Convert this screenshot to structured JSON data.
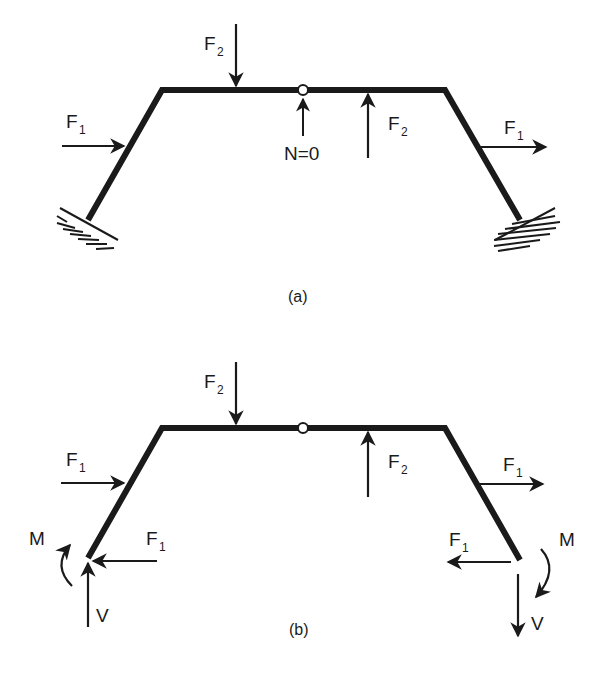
{
  "figure": {
    "panel_a": {
      "caption": "(a)",
      "labels": {
        "f2_top": "F",
        "f2_top_sub": "2",
        "f1_left": "F",
        "f1_left_sub": "1",
        "n_zero": "N=0",
        "f2_up": "F",
        "f2_up_sub": "2",
        "f1_right": "F",
        "f1_right_sub": "1"
      }
    },
    "panel_b": {
      "caption": "(b)",
      "labels": {
        "f2_top": "F",
        "f2_top_sub": "2",
        "f1_left": "F",
        "f1_left_sub": "1",
        "f2_up": "F",
        "f2_up_sub": "2",
        "f1_right": "F",
        "f1_right_sub": "1",
        "m_left": "M",
        "f1_reaction_left": "F",
        "f1_reaction_left_sub": "1",
        "v_left": "V",
        "m_right": "M",
        "f1_reaction_right": "F",
        "f1_reaction_right_sub": "1",
        "v_right": "V"
      }
    },
    "colors": {
      "ink": "#1a1a1a",
      "background": "#ffffff"
    }
  }
}
